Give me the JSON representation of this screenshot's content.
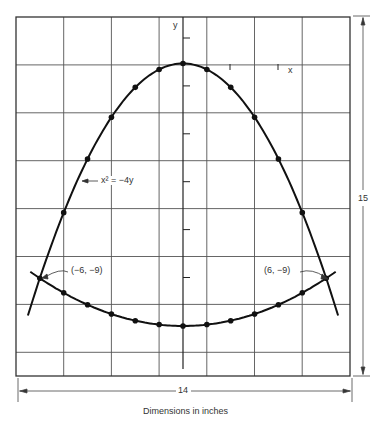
{
  "figure": {
    "caption": "Dimensions in inches",
    "width_label": "14",
    "height_label": "15",
    "axis_x_label": "x",
    "axis_y_label": "y",
    "equation_label": "x² = −4y",
    "left_point_label": "(−6, −9)",
    "right_point_label": "(6, −9)"
  },
  "chart_data": {
    "type": "line",
    "title": "",
    "xlabel": "x",
    "ylabel": "y",
    "grid": true,
    "grid_spacing_inches": 2,
    "xlim": [
      -7,
      7
    ],
    "ylim": [
      -15,
      2
    ],
    "series": [
      {
        "name": "x² = −4y",
        "marker_x": [
          -5,
          -4,
          -3,
          -2,
          -1,
          0,
          1,
          2,
          3,
          4,
          5
        ],
        "marker_y": [
          -6.25,
          -4,
          -2.25,
          -1,
          -0.25,
          0,
          -0.25,
          -1,
          -2.25,
          -4,
          -6.25
        ],
        "x_range": [
          -6.5,
          6.5
        ]
      },
      {
        "name": "lower curve",
        "marker_x": [
          -5,
          -4,
          -3,
          -2,
          -1,
          0,
          1,
          2,
          3,
          4,
          5
        ],
        "marker_y": [
          -9.61,
          -10.11,
          -10.5,
          -10.78,
          -10.94,
          -11,
          -10.94,
          -10.78,
          -10.5,
          -10.11,
          -9.61
        ],
        "x_range": [
          -6.4,
          6.4
        ]
      }
    ],
    "intersections": [
      {
        "label": "(−6, −9)",
        "x": -6,
        "y": -9
      },
      {
        "label": "(6, −9)",
        "x": 6,
        "y": -9
      }
    ],
    "dimensions": {
      "width": 14,
      "height": 15,
      "units": "inches"
    }
  }
}
